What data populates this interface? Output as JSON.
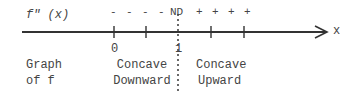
{
  "diagram": {
    "row_label_top": "f\" (x)",
    "signs_left": [
      "-",
      "-",
      "-",
      "-"
    ],
    "nd_label": "ND",
    "signs_right": [
      "+",
      "+",
      "+",
      "+"
    ],
    "axis_label": "x",
    "tick_labels": {
      "zero": "0",
      "one": "1"
    },
    "row_label_bottom": [
      "Graph",
      "of f"
    ],
    "left_region": [
      "Concave",
      "Downward"
    ],
    "right_region": [
      "Concave",
      "Upward"
    ],
    "colors": {
      "line": "#333333",
      "text": "#444444"
    }
  }
}
